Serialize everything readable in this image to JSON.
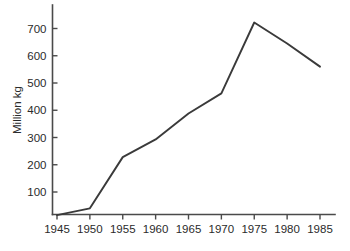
{
  "chart_data": {
    "type": "line",
    "title": "",
    "xlabel": "",
    "ylabel": "Million kg",
    "x": [
      1945,
      1950,
      1955,
      1960,
      1965,
      1970,
      1975,
      1980,
      1985
    ],
    "values": [
      15,
      40,
      228,
      293,
      388,
      462,
      722,
      645,
      560
    ],
    "xtick_labels": [
      "1945",
      "1950",
      "1955",
      "1960",
      "1965",
      "1970",
      "1975",
      "1980",
      "1985"
    ],
    "ytick_labels": [
      "100",
      "200",
      "300",
      "400",
      "500",
      "600",
      "700"
    ],
    "yticks": [
      100,
      200,
      300,
      400,
      500,
      600,
      700
    ],
    "xlim": [
      1945,
      1985
    ],
    "ylim": [
      0,
      780
    ],
    "grid": false,
    "legend": false,
    "series": [
      {
        "name": "Million kg",
        "values": [
          15,
          40,
          228,
          293,
          388,
          462,
          722,
          645,
          560
        ]
      }
    ],
    "line_color": "#3a3a3a",
    "background_color": "#ffffff",
    "axis_color": "#4a4a4a"
  }
}
